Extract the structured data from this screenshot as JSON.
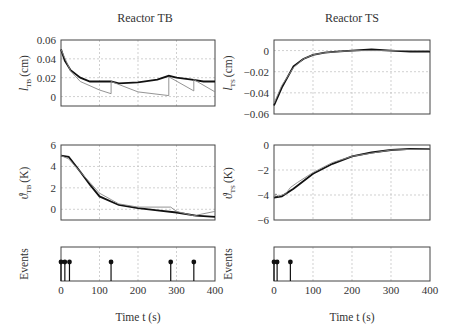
{
  "titles": {
    "left": "Reactor TB",
    "right": "Reactor TS"
  },
  "xlabel": "Time t (s)",
  "ylabels": {
    "l_tb": "l",
    "l_tb_sub": "TB",
    "l_unit": "(cm)",
    "theta_tb": "ϑ",
    "theta_tb_sub": "TB",
    "theta_unit": "(K)",
    "l_ts": "l",
    "l_ts_sub": "TS",
    "theta_ts": "ϑ",
    "theta_ts_sub": "TS",
    "events": "Events"
  },
  "chart_data": [
    {
      "type": "line",
      "title": "Reactor TB",
      "ylabel": "l_TB (cm)",
      "xlabel": "",
      "xlim": [
        0,
        400
      ],
      "ylim": [
        -0.01,
        0.06
      ],
      "yticks": [
        "0.06",
        "0.04",
        "0.02",
        "0"
      ],
      "grid": true,
      "series": [
        {
          "name": "measured",
          "x": [
            0,
            10,
            25,
            50,
            75,
            100,
            130,
            150,
            200,
            250,
            280,
            300,
            340,
            370,
            400
          ],
          "y": [
            0.05,
            0.038,
            0.028,
            0.02,
            0.016,
            0.016,
            0.016,
            0.014,
            0.015,
            0.018,
            0.022,
            0.02,
            0.018,
            0.016,
            0.016
          ]
        },
        {
          "name": "model",
          "x": [
            0,
            25,
            50,
            100,
            130,
            130,
            200,
            280,
            280,
            345,
            345,
            400
          ],
          "y": [
            0.05,
            0.027,
            0.016,
            0.007,
            0.003,
            0.016,
            0.005,
            0.001,
            0.021,
            0.006,
            0.018,
            0.005
          ]
        }
      ]
    },
    {
      "type": "line",
      "title": "",
      "ylabel": "ϑ_TB (K)",
      "xlim": [
        0,
        400
      ],
      "ylim": [
        -1,
        6
      ],
      "yticks": [
        "6",
        "4",
        "2",
        "0"
      ],
      "grid": true,
      "series": [
        {
          "name": "measured",
          "x": [
            0,
            20,
            50,
            75,
            100,
            150,
            200,
            250,
            300,
            350,
            400
          ],
          "y": [
            5,
            4.9,
            3.5,
            2.3,
            1.2,
            0.4,
            0.1,
            -0.1,
            -0.3,
            -0.6,
            -0.7
          ]
        },
        {
          "name": "model",
          "x": [
            0,
            20,
            50,
            75,
            100,
            130,
            150,
            200,
            285,
            300,
            345,
            400
          ],
          "y": [
            5,
            4.7,
            3.5,
            2.5,
            1.5,
            0.9,
            0.5,
            0.2,
            0.2,
            -0.2,
            -0.6,
            -0.2
          ]
        }
      ]
    },
    {
      "type": "line",
      "title": "Reactor TS",
      "ylabel": "l_TS (cm)",
      "xlim": [
        0,
        400
      ],
      "ylim": [
        -0.06,
        0.01
      ],
      "yticks": [
        "0",
        "-0.02",
        "-0.04",
        "-0.06"
      ],
      "grid": true,
      "series": [
        {
          "name": "measured",
          "x": [
            0,
            20,
            50,
            75,
            100,
            130,
            160,
            200,
            250,
            300,
            350,
            400
          ],
          "y": [
            -0.052,
            -0.035,
            -0.015,
            -0.008,
            -0.004,
            -0.002,
            -0.001,
            0,
            0.001,
            0,
            -0.001,
            -0.001
          ]
        },
        {
          "name": "model",
          "x": [
            0,
            20,
            50,
            75,
            100,
            130,
            200,
            400
          ],
          "y": [
            -0.05,
            -0.033,
            -0.016,
            -0.008,
            -0.004,
            -0.002,
            0,
            0
          ]
        }
      ]
    },
    {
      "type": "line",
      "title": "",
      "ylabel": "ϑ_TS (K)",
      "xlim": [
        0,
        400
      ],
      "ylim": [
        -6,
        0
      ],
      "yticks": [
        "0",
        "-2",
        "-4",
        "-6"
      ],
      "grid": true,
      "series": [
        {
          "name": "measured",
          "x": [
            0,
            20,
            50,
            100,
            150,
            200,
            250,
            300,
            350,
            400
          ],
          "y": [
            -4.2,
            -4.1,
            -3.5,
            -2.3,
            -1.5,
            -0.9,
            -0.6,
            -0.4,
            -0.3,
            -0.3
          ]
        },
        {
          "name": "model",
          "x": [
            0,
            5,
            10,
            30,
            42,
            60,
            100,
            150,
            200,
            300,
            400
          ],
          "y": [
            -4.2,
            -3.9,
            -4.1,
            -3.9,
            -3.4,
            -3,
            -2.2,
            -1.4,
            -0.9,
            -0.4,
            -0.3
          ]
        }
      ]
    },
    {
      "type": "stem",
      "title": "",
      "ylabel": "Events",
      "xlabel": "Time t (s)",
      "xlim": [
        0,
        400
      ],
      "xticks": [
        "0",
        "100",
        "200",
        "300",
        "400"
      ],
      "x": [
        0,
        10,
        22,
        130,
        285,
        345
      ]
    },
    {
      "type": "stem",
      "title": "",
      "ylabel": "Events",
      "xlabel": "Time t (s)",
      "xlim": [
        0,
        400
      ],
      "xticks": [
        "0",
        "100",
        "200",
        "300",
        "400"
      ],
      "x": [
        0,
        8,
        42
      ]
    }
  ]
}
